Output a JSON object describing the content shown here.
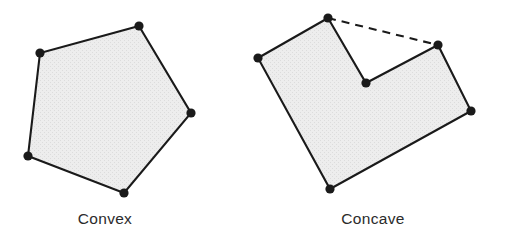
{
  "figure": {
    "background_color": "#ffffff",
    "width": 506,
    "height": 240,
    "outline_color": "#1a1a1a",
    "fill_color": "#e9e9e9",
    "vertex_color": "#1a1a1a",
    "text_color": "#2b2b2b"
  },
  "panels": [
    {
      "id": "convex",
      "caption": "Convex",
      "caption_x": 105,
      "caption_y": 224,
      "shape_type": "polygon",
      "vertex_count": 5,
      "has_dashed_hull_edge": false,
      "vertices": [
        {
          "label": "top",
          "x": 139,
          "y": 26
        },
        {
          "label": "right",
          "x": 191,
          "y": 113
        },
        {
          "label": "bottom",
          "x": 124,
          "y": 193
        },
        {
          "label": "bottom-left",
          "x": 28,
          "y": 156
        },
        {
          "label": "left-top",
          "x": 40,
          "y": 53
        }
      ],
      "points_attr": "139,26 191,113 124,193 28,156 40,53"
    },
    {
      "id": "concave",
      "caption": "Concave",
      "caption_x": 373,
      "caption_y": 224,
      "shape_type": "polygon",
      "vertex_count": 6,
      "has_dashed_hull_edge": true,
      "vertices": [
        {
          "label": "top",
          "x": 328,
          "y": 18
        },
        {
          "label": "reflex-notch",
          "x": 366,
          "y": 83
        },
        {
          "label": "upper-right",
          "x": 438,
          "y": 45
        },
        {
          "label": "right",
          "x": 471,
          "y": 111
        },
        {
          "label": "bottom",
          "x": 330,
          "y": 189
        },
        {
          "label": "left",
          "x": 258,
          "y": 58
        }
      ],
      "points_attr": "328,18 366,83 438,45 471,111 330,189 258,58",
      "dashed_hull_edge": {
        "from_label": "top",
        "to_label": "upper-right",
        "x1": 328,
        "y1": 18,
        "x2": 438,
        "y2": 45
      }
    }
  ]
}
